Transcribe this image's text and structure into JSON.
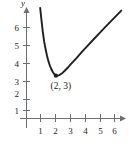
{
  "figure": {
    "title": "",
    "background_color": "#ffffff",
    "axis_color": "#6d6e71",
    "curve_color": "#231f20",
    "text_color": "#231f20"
  },
  "chart_data": {
    "type": "line",
    "title": "",
    "xlabel": "",
    "ylabel": "y",
    "xlim": [
      -0.45,
      6.9
    ],
    "ylim": [
      -0.6,
      7.3
    ],
    "grid": false,
    "legend": null,
    "x_ticks": [
      1,
      2,
      3,
      4,
      5,
      6
    ],
    "x_tick_labels": [
      "1",
      "2",
      "3",
      "4",
      "5",
      "6"
    ],
    "y_ticks": [
      1,
      2,
      3,
      4,
      5,
      6
    ],
    "y_tick_labels": [
      "1",
      "2",
      "3",
      "4",
      "5",
      "6"
    ],
    "series": [
      {
        "name": "curve",
        "x": [
          0.93,
          1.0,
          1.1,
          1.2,
          1.3,
          1.4,
          1.5,
          1.6,
          1.7,
          1.8,
          1.9,
          2.0,
          2.2,
          2.4,
          2.6,
          2.8,
          3.0,
          3.4,
          3.8,
          4.2,
          4.6,
          5.0,
          5.4,
          5.8,
          6.2,
          6.45
        ],
        "y": [
          6.85,
          6.3,
          5.55,
          4.95,
          4.5,
          4.12,
          3.8,
          3.55,
          3.35,
          3.2,
          3.08,
          3.0,
          3.02,
          3.12,
          3.28,
          3.45,
          3.64,
          4.0,
          4.38,
          4.74,
          5.1,
          5.45,
          5.8,
          6.14,
          6.48,
          6.7
        ]
      }
    ],
    "annotations": [
      {
        "text": "(2, 3)",
        "point_x": 2,
        "point_y": 3,
        "marker": "dot",
        "label_position": "below"
      }
    ]
  },
  "labels": {
    "y_axis_name": "y",
    "minimum_point": "(2, 3)"
  }
}
